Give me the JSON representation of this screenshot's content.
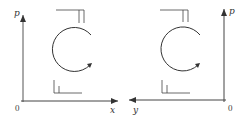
{
  "figure": {
    "left_panel": {
      "y_axis_label": "p",
      "x_axis_label": "x",
      "origin_label": "0",
      "rotation": "clockwise"
    },
    "right_panel": {
      "y_axis_label": "p",
      "x_axis_label": "y",
      "origin_label": "0",
      "rotation": "clockwise"
    }
  },
  "colors": {
    "stroke": "#333333",
    "background": "#ffffff"
  }
}
